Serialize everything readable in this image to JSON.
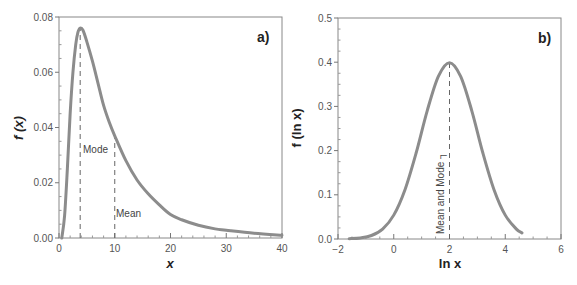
{
  "chart_data": [
    {
      "type": "line",
      "panel_label": "a)",
      "title": "",
      "xlabel": "x",
      "ylabel": "f (x)",
      "xlim": [
        0,
        40
      ],
      "ylim": [
        0,
        0.08
      ],
      "xticks": [
        0,
        10,
        20,
        30,
        40
      ],
      "xtick_labels": [
        "0",
        "10",
        "20",
        "30",
        "40"
      ],
      "yticks": [
        0,
        0.02,
        0.04,
        0.06,
        0.08
      ],
      "ytick_labels": [
        "0.00",
        "0.02",
        "0.04",
        "0.06",
        "0.08"
      ],
      "grid": false,
      "series": [
        {
          "name": "lognormal density f(x)",
          "color": "#8c8c8c",
          "x": [
            0.5,
            1,
            1.5,
            2,
            2.5,
            3,
            3.4,
            3.8,
            4.3,
            5,
            6,
            7,
            8,
            9,
            10,
            12,
            14,
            16,
            18,
            20,
            22,
            25,
            28,
            30,
            35,
            40
          ],
          "y": [
            0.0,
            0.008,
            0.025,
            0.045,
            0.06,
            0.07,
            0.0745,
            0.076,
            0.0752,
            0.071,
            0.064,
            0.056,
            0.048,
            0.042,
            0.037,
            0.028,
            0.021,
            0.016,
            0.012,
            0.0085,
            0.0066,
            0.0046,
            0.0033,
            0.0028,
            0.0017,
            0.001
          ]
        }
      ],
      "annotations": [
        {
          "text": "Mode",
          "x": 3.8,
          "line_from": 0,
          "line_to": 0.076
        },
        {
          "text": "Mean",
          "x": 10,
          "line_from": 0,
          "line_to": 0.037
        }
      ]
    },
    {
      "type": "line",
      "panel_label": "b)",
      "title": "",
      "xlabel": "ln x",
      "ylabel": "f (ln x)",
      "xlim": [
        -2,
        6
      ],
      "ylim": [
        0,
        0.5
      ],
      "xticks": [
        -2,
        0,
        2,
        4,
        6
      ],
      "xtick_labels": [
        "−2",
        "0",
        "2",
        "4",
        "6"
      ],
      "yticks": [
        0,
        0.1,
        0.2,
        0.3,
        0.4,
        0.5
      ],
      "ytick_labels": [
        "0.0",
        "0.1",
        "0.2",
        "0.3",
        "0.4",
        "0.5"
      ],
      "grid": false,
      "series": [
        {
          "name": "normal density f(ln x)",
          "color": "#8c8c8c",
          "x": [
            -1.6,
            -1.2,
            -0.8,
            -0.4,
            0,
            0.4,
            0.8,
            1.2,
            1.6,
            2.0,
            2.4,
            2.8,
            3.2,
            3.6,
            4.0,
            4.4,
            4.6
          ],
          "y": [
            0.0006,
            0.0024,
            0.0079,
            0.0224,
            0.054,
            0.111,
            0.194,
            0.29,
            0.368,
            0.399,
            0.368,
            0.29,
            0.194,
            0.111,
            0.054,
            0.0224,
            0.0137
          ]
        }
      ],
      "annotations": [
        {
          "text": "Mean and Mode",
          "x": 2,
          "line_from": 0,
          "line_to": 0.399
        }
      ]
    }
  ],
  "labels": {
    "a": {
      "panel": "a)",
      "xlabel": "x",
      "ylabel": "f (x)",
      "mode": "Mode",
      "mean": "Mean"
    },
    "b": {
      "panel": "b)",
      "xlabel": "ln x",
      "ylabel": "f (ln x)",
      "mean_mode": "Mean and Mode ┐"
    }
  }
}
